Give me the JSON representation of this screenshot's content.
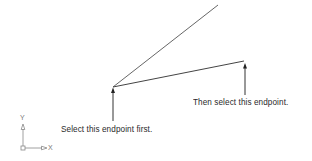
{
  "diagram": {
    "lines": [
      {
        "name": "upper-line",
        "x1": 113,
        "y1": 87,
        "x2": 218,
        "y2": 5
      },
      {
        "name": "lower-line",
        "x1": 113,
        "y1": 87,
        "x2": 244,
        "y2": 61
      }
    ],
    "callouts": [
      {
        "name": "first-endpoint",
        "text": "Select this endpoint first.",
        "arrow_x": 113,
        "arrow_top": 88,
        "arrow_bottom": 121
      },
      {
        "name": "second-endpoint",
        "text": "Then select this endpoint.",
        "arrow_x": 245,
        "arrow_top": 63,
        "arrow_bottom": 95
      }
    ],
    "ucs_icon": {
      "x_label": "X",
      "y_label": "Y"
    },
    "colors": {
      "line": "#4a4a4a",
      "arrow": "#3a3a3a",
      "text": "#2a2a2a",
      "ucs": "#8a8a8a"
    }
  }
}
